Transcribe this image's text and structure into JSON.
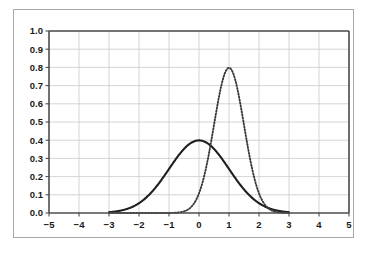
{
  "figure": {
    "background_color": "#ffffff",
    "frame_color": "#a9a9a9"
  },
  "chart_data": {
    "type": "line",
    "title": "",
    "subtitle": "",
    "xlabel": "",
    "ylabel": "",
    "xlim": [
      -5,
      5
    ],
    "ylim": [
      0.0,
      1.0
    ],
    "xticks": [
      -5,
      -4,
      -3,
      -2,
      -1,
      0,
      1,
      2,
      3,
      4,
      5
    ],
    "xtick_labels": [
      "−5",
      "−4",
      "−3",
      "−2",
      "−1",
      "0",
      "1",
      "2",
      "3",
      "4",
      "5"
    ],
    "yticks": [
      0.0,
      0.1,
      0.2,
      0.3,
      0.4,
      0.5,
      0.6,
      0.7,
      0.8,
      0.9,
      1.0
    ],
    "ytick_labels": [
      "0.0",
      "0.1",
      "0.2",
      "0.3",
      "0.4",
      "0.5",
      "0.6",
      "0.7",
      "0.8",
      "0.9",
      "1.0"
    ],
    "grid": true,
    "grid_color": "#c9c9c9",
    "legend": null,
    "legend_position": "none",
    "domain": [
      -3,
      3
    ],
    "series": [
      {
        "name": "standard-normal",
        "style": "solid",
        "color": "#1f1f1f",
        "mean": 0,
        "sigma": 1,
        "peak_x": 0,
        "peak_y": 0.399,
        "x": [
          -3.0,
          -2.75,
          -2.5,
          -2.25,
          -2.0,
          -1.75,
          -1.5,
          -1.25,
          -1.0,
          -0.75,
          -0.5,
          -0.25,
          0.0,
          0.25,
          0.5,
          0.75,
          1.0,
          1.25,
          1.5,
          1.75,
          2.0,
          2.25,
          2.5,
          2.75,
          3.0
        ],
        "values": [
          0.004,
          0.009,
          0.018,
          0.032,
          0.054,
          0.086,
          0.13,
          0.183,
          0.242,
          0.301,
          0.352,
          0.387,
          0.399,
          0.387,
          0.352,
          0.301,
          0.242,
          0.183,
          0.13,
          0.086,
          0.054,
          0.032,
          0.018,
          0.009,
          0.004
        ]
      },
      {
        "name": "shifted-narrow-normal",
        "style": "dotted",
        "color": "#3a3a3a",
        "mean": 1,
        "sigma": 0.5,
        "peak_x": 1,
        "peak_y": 0.798,
        "x": [
          -3.0,
          -2.5,
          -2.0,
          -1.5,
          -1.0,
          -0.75,
          -0.5,
          -0.25,
          0.0,
          0.25,
          0.5,
          0.75,
          1.0,
          1.25,
          1.5,
          1.75,
          2.0,
          2.25,
          2.5,
          2.75,
          3.0
        ],
        "values": [
          0.0,
          0.0,
          0.0,
          0.0001,
          0.0003,
          0.001,
          0.0089,
          0.0088,
          0.108,
          0.264,
          0.484,
          0.704,
          0.798,
          0.704,
          0.484,
          0.264,
          0.108,
          0.032,
          0.009,
          0.002,
          0.0003
        ]
      }
    ]
  }
}
